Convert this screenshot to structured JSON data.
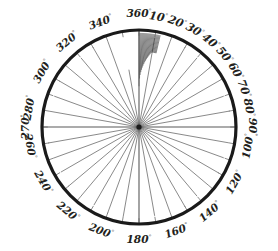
{
  "figure": {
    "kind": "polar-diagram",
    "background_color": "#ffffff"
  },
  "geometry": {
    "center_x": 139,
    "center_y": 127,
    "radius": 97,
    "rim_color": "#1a1a1a",
    "rim_width": 3.2,
    "spoke_color": "#6b6b6b",
    "spoke_width": 0.8,
    "axis_color": "#585858",
    "axis_width": 1.1,
    "hatch_color": "#2b2b2b",
    "hatch_width": 0.55
  },
  "degree_symbol": "°",
  "labels": [
    {
      "text": "10",
      "angle": 10
    },
    {
      "text": "20",
      "angle": 20
    },
    {
      "text": "30",
      "angle": 30
    },
    {
      "text": "40",
      "angle": 40
    },
    {
      "text": "50",
      "angle": 50
    },
    {
      "text": "60",
      "angle": 60
    },
    {
      "text": "70",
      "angle": 70
    },
    {
      "text": "80",
      "angle": 80
    },
    {
      "text": "90",
      "angle": 90
    },
    {
      "text": "100",
      "angle": 100
    },
    {
      "text": "120",
      "angle": 120
    },
    {
      "text": "140",
      "angle": 140
    },
    {
      "text": "160",
      "angle": 160
    },
    {
      "text": "180",
      "angle": 180
    },
    {
      "text": "200",
      "angle": 200
    },
    {
      "text": "220",
      "angle": 220
    },
    {
      "text": "240",
      "angle": 240
    },
    {
      "text": "260",
      "angle": 260
    },
    {
      "text": "270",
      "angle": 270
    },
    {
      "text": "280",
      "angle": 280
    },
    {
      "text": "300",
      "angle": 300
    },
    {
      "text": "320",
      "angle": 320
    },
    {
      "text": "340",
      "angle": 340
    },
    {
      "text": "360",
      "angle": 360
    }
  ],
  "chart_data": {
    "type": "scatter",
    "xlabel": "",
    "ylabel": "",
    "angular_unit": "degrees",
    "angular_range": [
      0,
      360
    ],
    "angular_tick_interval": 10,
    "zero_direction": "up",
    "angular_direction": "clockwise",
    "grid": false,
    "legend": null,
    "tick_labels": [
      "10",
      "20",
      "30",
      "40",
      "50",
      "60",
      "70",
      "80",
      "90",
      "100",
      "120",
      "140",
      "160",
      "180",
      "200",
      "220",
      "240",
      "260",
      "270",
      "280",
      "300",
      "320",
      "340",
      "360"
    ],
    "axes": [
      {
        "name": "vertical-axis",
        "from_angle": 360,
        "to_angle": 180
      },
      {
        "name": "horizontal-axis",
        "from_angle": 270,
        "to_angle": 90
      }
    ],
    "spokes": [
      {
        "angle": 10,
        "inner": 0.0,
        "outer": 0.93
      },
      {
        "angle": 20,
        "inner": 0.0,
        "outer": 0.94
      },
      {
        "angle": 30,
        "inner": 0.0,
        "outer": 0.95
      },
      {
        "angle": 40,
        "inner": 0.0,
        "outer": 0.93
      },
      {
        "angle": 50,
        "inner": 0.0,
        "outer": 0.95
      },
      {
        "angle": 60,
        "inner": 0.0,
        "outer": 0.94
      },
      {
        "angle": 70,
        "inner": 0.0,
        "outer": 0.93
      },
      {
        "angle": 80,
        "inner": 0.0,
        "outer": 0.95
      },
      {
        "angle": 100,
        "inner": 0.0,
        "outer": 0.94
      },
      {
        "angle": 110,
        "inner": 0.0,
        "outer": 0.93
      },
      {
        "angle": 120,
        "inner": 0.0,
        "outer": 0.95
      },
      {
        "angle": 130,
        "inner": 0.0,
        "outer": 0.94
      },
      {
        "angle": 140,
        "inner": 0.0,
        "outer": 0.93
      },
      {
        "angle": 150,
        "inner": 0.0,
        "outer": 0.95
      },
      {
        "angle": 160,
        "inner": 0.0,
        "outer": 0.94
      },
      {
        "angle": 170,
        "inner": 0.0,
        "outer": 0.93
      },
      {
        "angle": 190,
        "inner": 0.0,
        "outer": 0.94
      },
      {
        "angle": 200,
        "inner": 0.0,
        "outer": 0.95
      },
      {
        "angle": 210,
        "inner": 0.0,
        "outer": 0.93
      },
      {
        "angle": 220,
        "inner": 0.0,
        "outer": 0.94
      },
      {
        "angle": 230,
        "inner": 0.0,
        "outer": 0.95
      },
      {
        "angle": 240,
        "inner": 0.0,
        "outer": 0.93
      },
      {
        "angle": 250,
        "inner": 0.0,
        "outer": 0.94
      },
      {
        "angle": 260,
        "inner": 0.0,
        "outer": 0.95
      },
      {
        "angle": 280,
        "inner": 0.0,
        "outer": 0.94
      },
      {
        "angle": 290,
        "inner": 0.0,
        "outer": 0.93
      },
      {
        "angle": 300,
        "inner": 0.0,
        "outer": 0.95
      },
      {
        "angle": 310,
        "inner": 0.0,
        "outer": 0.94
      },
      {
        "angle": 320,
        "inner": 0.0,
        "outer": 0.93
      },
      {
        "angle": 330,
        "inner": 0.0,
        "outer": 0.95
      },
      {
        "angle": 340,
        "inner": 0.0,
        "outer": 0.94
      },
      {
        "angle": 350,
        "inner": 0.0,
        "outer": 0.6
      }
    ],
    "hatch_sector": {
      "name": "dense-hatch-sector",
      "start_angle": 0,
      "end_angle": 13,
      "line_count": 22,
      "radius_outer": 0.97,
      "radius_inner_min": 0.42,
      "radius_inner_max": 0.78,
      "description": "dense fine radial tally lines between 0 and 13 degrees near the rim"
    },
    "rim_ticks": {
      "name": "rim-tick-marks",
      "interval": 10,
      "length": 0.06
    }
  }
}
